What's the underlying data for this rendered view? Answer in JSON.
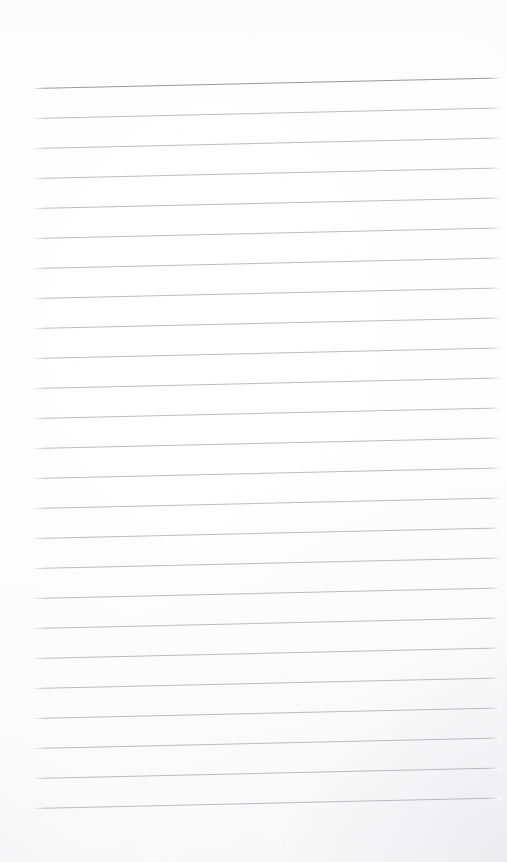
{
  "document": {
    "kind": "scanned-ruled-notebook-page",
    "title": "Blank ruled notebook page",
    "text_content": "",
    "page_width": 507,
    "page_height": 862,
    "paper_color": "#fdfdfd",
    "background_color": "#ffffff"
  },
  "ruling": {
    "line_color": "#a9aaae",
    "header_line_color": "#8f9095",
    "line_count": 25,
    "line_spacing_px": 30,
    "first_line_y": 88,
    "last_line_y": 808,
    "line_start_x": 33,
    "line_end_x": 501,
    "skew_degrees": -1.3,
    "header_line_index": 0,
    "lines": [
      {
        "index": 0,
        "y": 88,
        "weight": "heavy"
      },
      {
        "index": 1,
        "y": 118,
        "weight": "light"
      },
      {
        "index": 2,
        "y": 148,
        "weight": "light"
      },
      {
        "index": 3,
        "y": 178,
        "weight": "light"
      },
      {
        "index": 4,
        "y": 208,
        "weight": "light"
      },
      {
        "index": 5,
        "y": 238,
        "weight": "light"
      },
      {
        "index": 6,
        "y": 268,
        "weight": "light"
      },
      {
        "index": 7,
        "y": 298,
        "weight": "light"
      },
      {
        "index": 8,
        "y": 328,
        "weight": "light"
      },
      {
        "index": 9,
        "y": 358,
        "weight": "light"
      },
      {
        "index": 10,
        "y": 388,
        "weight": "light"
      },
      {
        "index": 11,
        "y": 418,
        "weight": "light"
      },
      {
        "index": 12,
        "y": 448,
        "weight": "light"
      },
      {
        "index": 13,
        "y": 478,
        "weight": "light"
      },
      {
        "index": 14,
        "y": 508,
        "weight": "light"
      },
      {
        "index": 15,
        "y": 538,
        "weight": "light"
      },
      {
        "index": 16,
        "y": 568,
        "weight": "light"
      },
      {
        "index": 17,
        "y": 598,
        "weight": "light"
      },
      {
        "index": 18,
        "y": 628,
        "weight": "light"
      },
      {
        "index": 19,
        "y": 658,
        "weight": "light"
      },
      {
        "index": 20,
        "y": 688,
        "weight": "light"
      },
      {
        "index": 21,
        "y": 718,
        "weight": "light"
      },
      {
        "index": 22,
        "y": 748,
        "weight": "light"
      },
      {
        "index": 23,
        "y": 778,
        "weight": "light"
      },
      {
        "index": 24,
        "y": 808,
        "weight": "light"
      }
    ]
  },
  "margins": {
    "top_blank_px": 88,
    "bottom_blank_px": 54,
    "left_blank_px": 33,
    "right_blank_px": 6
  }
}
